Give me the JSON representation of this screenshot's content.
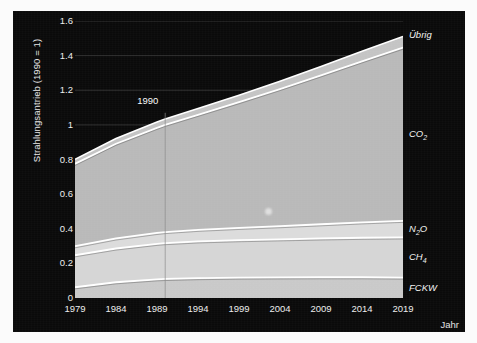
{
  "chart_data": {
    "type": "area",
    "title": "",
    "subtitle": "",
    "xlabel": "Jahr",
    "ylabel": "Strahlungsantrieb (1990 = 1)",
    "stacked": true,
    "grid": true,
    "legend_position": "right-inline",
    "xlim": [
      1979,
      2019
    ],
    "ylim": [
      0,
      1.6
    ],
    "xticks": [
      "1979",
      "1984",
      "1989",
      "1994",
      "1999",
      "2004",
      "2009",
      "2014",
      "2019"
    ],
    "xtick_values": [
      1979,
      1984,
      1989,
      1994,
      1999,
      2004,
      2009,
      2014,
      2019
    ],
    "yticks": [
      "0",
      "0.2",
      "0.4",
      "0.6",
      "0.8",
      "1",
      "1.2",
      "1.4",
      "1.6"
    ],
    "ytick_values": [
      0,
      0.2,
      0.4,
      0.6,
      0.8,
      1.0,
      1.2,
      1.4,
      1.6
    ],
    "annotations": [
      {
        "text": "1990",
        "x": 1990,
        "y": 1.07,
        "line": true
      }
    ],
    "x": [
      1979,
      1984,
      1989,
      1990,
      1994,
      1999,
      2004,
      2009,
      2014,
      2019
    ],
    "series": [
      {
        "name": "FCKW",
        "label": "FCKW",
        "color": "#c9c9c9",
        "values": [
          0.062,
          0.091,
          0.108,
          0.11,
          0.115,
          0.118,
          0.119,
          0.12,
          0.12,
          0.118
        ]
      },
      {
        "name": "CH4",
        "label": "CH₄",
        "color": "#d6d6d6",
        "values": [
          0.185,
          0.195,
          0.205,
          0.207,
          0.212,
          0.216,
          0.22,
          0.224,
          0.228,
          0.232
        ]
      },
      {
        "name": "N2O",
        "label": "N₂O",
        "color": "#dcdcdc",
        "values": [
          0.052,
          0.058,
          0.063,
          0.064,
          0.067,
          0.071,
          0.076,
          0.082,
          0.089,
          0.096
        ]
      },
      {
        "name": "CO2",
        "label": "CO₂",
        "color": "#b9b9b9",
        "values": [
          0.476,
          0.547,
          0.607,
          0.619,
          0.664,
          0.726,
          0.792,
          0.86,
          0.93,
          1.0
        ]
      },
      {
        "name": "Übrig",
        "label": "Übrig",
        "color": "#c4c4c4",
        "values": [
          0.026,
          0.03,
          0.033,
          0.034,
          0.036,
          0.04,
          0.045,
          0.051,
          0.058,
          0.065
        ]
      }
    ],
    "totals": [
      0.801,
      0.921,
      1.016,
      1.034,
      1.094,
      1.171,
      1.252,
      1.337,
      1.425,
      1.511
    ]
  },
  "labels": {
    "ubrig": "Übrig",
    "co2_main": "CO",
    "co2_sub": "2",
    "n2o_a": "N",
    "n2o_sub": "2",
    "n2o_b": "O",
    "ch4_main": "CH",
    "ch4_sub": "4",
    "fckw": "FCKW",
    "anno_1990": "1990",
    "axis_x": "Jahr",
    "axis_y": "Strahlungsantrieb (1990 = 1)"
  },
  "colors": {
    "panel_background": "#0a0a0a",
    "page_background": "#fbfbfb",
    "gridline": "#3a3a3a",
    "band_separator": "#ffffff",
    "text": "#ededed"
  }
}
